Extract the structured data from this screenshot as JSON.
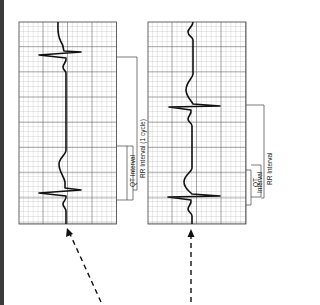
{
  "figure": {
    "colors": {
      "grid_minor": "#9a9a9a",
      "grid_major": "#555555",
      "trace": "#111111",
      "edge_bar": "#3a3a3a"
    },
    "strips": [
      {
        "id": "left",
        "labels": {
          "qt": "QT Interval",
          "rr": "RR Interval (1 cycle)"
        },
        "arrow": "dashed-diagonal"
      },
      {
        "id": "right",
        "labels": {
          "qt_line1": "QT",
          "qt_line2": "Interval",
          "rr": "RR Interval"
        },
        "arrow": "dashed-vertical"
      }
    ]
  }
}
